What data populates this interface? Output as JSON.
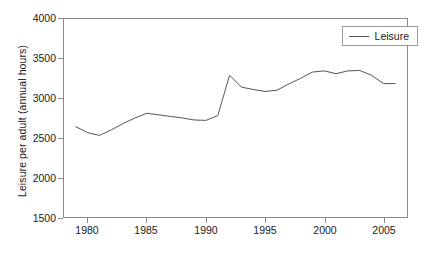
{
  "chart_data": {
    "type": "line",
    "title": "",
    "xlabel": "",
    "ylabel": "Leisure per adult (annual hours)",
    "xlim": [
      1978,
      2007
    ],
    "ylim": [
      1500,
      4000
    ],
    "grid": false,
    "legend_position": "top-right",
    "xticks": [
      1980,
      1985,
      1990,
      1995,
      2000,
      2005
    ],
    "yticks": [
      1500,
      2000,
      2500,
      3000,
      3500,
      4000
    ],
    "series": [
      {
        "name": "Leisure",
        "color": "#555555",
        "x": [
          1979,
          1980,
          1981,
          1982,
          1983,
          1984,
          1985,
          1986,
          1987,
          1988,
          1989,
          1990,
          1991,
          1992,
          1993,
          1994,
          1995,
          1996,
          1997,
          1998,
          1999,
          2000,
          2001,
          2002,
          2003,
          2004,
          2005,
          2006
        ],
        "values": [
          2640,
          2565,
          2530,
          2600,
          2680,
          2750,
          2810,
          2790,
          2770,
          2750,
          2725,
          2720,
          2780,
          3290,
          3140,
          3110,
          3085,
          3100,
          3180,
          3250,
          3330,
          3345,
          3310,
          3345,
          3350,
          3290,
          3185,
          3185
        ]
      }
    ],
    "legend": [
      {
        "label": "Leisure",
        "color": "#555555"
      }
    ]
  },
  "axes": {
    "y_tick_labels": [
      "4000",
      "3500",
      "3000",
      "2500",
      "2000",
      "1500"
    ],
    "x_tick_labels": [
      "1980",
      "1985",
      "1990",
      "1995",
      "2000",
      "2005"
    ],
    "y_axis_title": "Leisure per adult (annual hours)"
  }
}
